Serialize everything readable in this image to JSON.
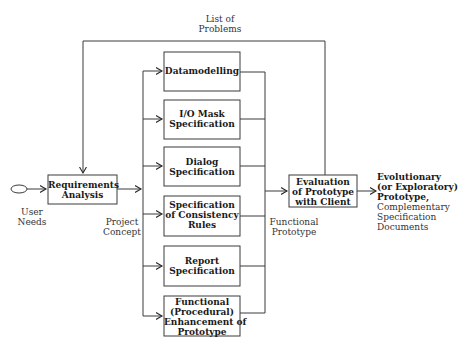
{
  "diagram": {
    "type": "flowchart",
    "start_node": {
      "shape": "ellipse"
    },
    "labels": {
      "feedback": "List of\nProblems",
      "user_needs": "User\nNeeds",
      "project_concept": "Project\nConcept",
      "functional_prototype": "Functional\nPrototype"
    },
    "nodes": {
      "requirements": "Requirements\nAnalysis",
      "datamodelling": "Datamodelling",
      "io_mask": "I/O Mask\nSpecification",
      "dialog": "Dialog\nSpecification",
      "consistency": "Specification\nof Consistency\nRules",
      "report": "Report\nSpecification",
      "functional": "Functional\n(Procedural)\nEnhancement of\nPrototype",
      "evaluation": "Evaluation\nof Prototype\nwith Client"
    },
    "output": {
      "bold": "Evolutionary\n(or Exploratory)\nPrototype,",
      "plain": "Complementary\nSpecification\nDocuments"
    },
    "colors": {
      "line": "#3a3a3a",
      "text": "#1a1a1a"
    }
  }
}
